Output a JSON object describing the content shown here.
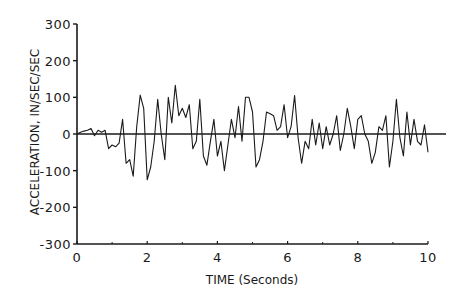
{
  "chart_data": {
    "type": "line",
    "title": "",
    "xlabel": "TIME (Seconds)",
    "ylabel": "ACCELERATION, IN/SEC/SEC",
    "xlim": [
      0,
      10
    ],
    "ylim": [
      -300,
      300
    ],
    "x_ticks": [
      0,
      2,
      4,
      6,
      8,
      10
    ],
    "x_tick_labels": [
      "0",
      "2",
      "4",
      "6",
      "8",
      "10"
    ],
    "x_minor_ticks": [
      1,
      3,
      5,
      7,
      9
    ],
    "y_ticks": [
      300,
      200,
      100,
      0,
      -100,
      -200,
      -300
    ],
    "y_tick_labels": [
      "300",
      "200",
      "100",
      "0",
      "-100",
      "-200",
      "-300"
    ],
    "grid": false,
    "legend": null,
    "zero_line": true,
    "line_color": "#1a1a1a",
    "series": [
      {
        "name": "Acceleration",
        "x": [
          0.0,
          0.1,
          0.2,
          0.3,
          0.4,
          0.5,
          0.6,
          0.7,
          0.8,
          0.9,
          1.0,
          1.1,
          1.2,
          1.3,
          1.4,
          1.5,
          1.6,
          1.7,
          1.8,
          1.9,
          2.0,
          2.1,
          2.2,
          2.3,
          2.4,
          2.5,
          2.6,
          2.7,
          2.8,
          2.9,
          3.0,
          3.1,
          3.2,
          3.3,
          3.4,
          3.5,
          3.6,
          3.7,
          3.8,
          3.9,
          4.0,
          4.1,
          4.2,
          4.3,
          4.4,
          4.5,
          4.6,
          4.7,
          4.8,
          4.9,
          5.0,
          5.1,
          5.2,
          5.3,
          5.4,
          5.5,
          5.6,
          5.7,
          5.8,
          5.9,
          6.0,
          6.1,
          6.2,
          6.3,
          6.4,
          6.5,
          6.6,
          6.7,
          6.8,
          6.9,
          7.0,
          7.1,
          7.2,
          7.3,
          7.4,
          7.5,
          7.6,
          7.7,
          7.8,
          7.9,
          8.0,
          8.1,
          8.2,
          8.3,
          8.4,
          8.5,
          8.6,
          8.7,
          8.8,
          8.9,
          9.0,
          9.1,
          9.2,
          9.3,
          9.4,
          9.5,
          9.6,
          9.7,
          9.8,
          9.9,
          10.0
        ],
        "values": [
          0,
          5,
          8,
          10,
          15,
          -5,
          10,
          5,
          10,
          -40,
          -30,
          -35,
          -25,
          40,
          -80,
          -70,
          -115,
          20,
          106,
          70,
          -125,
          -90,
          -20,
          95,
          0,
          -70,
          100,
          30,
          133,
          50,
          70,
          45,
          80,
          -40,
          -20,
          95,
          -60,
          -85,
          -20,
          40,
          -60,
          -20,
          -100,
          -30,
          40,
          -10,
          75,
          -20,
          100,
          100,
          60,
          -90,
          -70,
          -20,
          60,
          55,
          50,
          10,
          20,
          80,
          -10,
          20,
          105,
          -10,
          -80,
          -20,
          -40,
          40,
          -30,
          30,
          -40,
          20,
          -30,
          0,
          50,
          -45,
          0,
          70,
          20,
          -40,
          40,
          50,
          0,
          -20,
          -80,
          -50,
          20,
          10,
          50,
          -90,
          -20,
          95,
          -10,
          -60,
          60,
          -30,
          40,
          -20,
          -30,
          25,
          -50
        ]
      }
    ]
  }
}
